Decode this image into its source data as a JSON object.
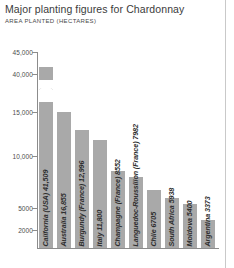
{
  "chart_data": {
    "type": "bar",
    "title": "Major planting figures for Chardonnay",
    "subtitle": "AREA PLANTED (HECTARES)",
    "xlabel": "",
    "ylabel": "",
    "categories": [
      "California (USA) 41,509",
      "Australia 16,855",
      "Burgundy (France) 12,996",
      "Italy 11,800",
      "Champagne (France) 8552",
      "Languedoc-Roussillon (France) 7982",
      "Chile 6705",
      "South Africa 5938",
      "Moldova 5400",
      "Argentina 3373"
    ],
    "names": [
      "California (USA)",
      "Australia",
      "Burgundy (France)",
      "Italy",
      "Champagne (France)",
      "Languedoc-Roussillon (France)",
      "Chile",
      "South Africa",
      "Moldova",
      "Argentina"
    ],
    "values": [
      41509,
      16855,
      12996,
      11800,
      8552,
      7982,
      6705,
      5938,
      5400,
      3373
    ],
    "ytick_labels": [
      "45,000",
      "40,000",
      "15,000",
      "10,000",
      "5000",
      "2000"
    ],
    "ytick_values": [
      45000,
      40000,
      15000,
      10000,
      5000,
      2000
    ],
    "broken_axis": true,
    "grid": false,
    "legend": null,
    "bar_color": "#a9a9a9",
    "axis_color": "#8c8c8c"
  }
}
